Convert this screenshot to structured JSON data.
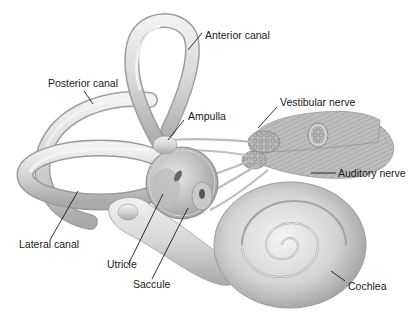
{
  "diagram": {
    "background": "#ffffff",
    "structure_fill": "#d9d9d9",
    "structure_shadow": "#a8a8a8",
    "label_color": "#1a1a1a",
    "labels": {
      "anterior_canal": "Anterior canal",
      "posterior_canal": "Posterior canal",
      "ampulla": "Ampulla",
      "vestibular_nerve": "Vestibular nerve",
      "auditory_nerve": "Auditory nerve",
      "lateral_canal": "Lateral canal",
      "utricle": "Utricle",
      "saccule": "Saccule",
      "cochlea": "Cochlea"
    }
  }
}
